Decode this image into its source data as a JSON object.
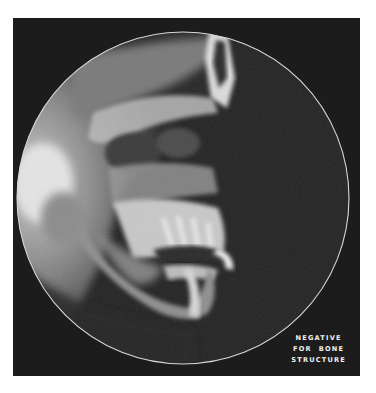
{
  "figure": {
    "background_color": "#ffffff",
    "panel_color": "#1c1c1c",
    "circle_outline_color": "#d8d8d8",
    "caption": {
      "lines": [
        "NEGATIVE",
        "FOR  BONE",
        "STRUCTURE"
      ]
    }
  }
}
